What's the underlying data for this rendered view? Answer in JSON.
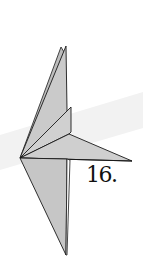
{
  "diagram": {
    "type": "origami-fold-step",
    "step_label": "16.",
    "colors": {
      "paper_fill": "#c9c9c9",
      "paper_fill_light": "#d6d6d6",
      "outline": "#1a1a1a",
      "background": "#ffffff",
      "background_band": "#f1f1f1"
    }
  }
}
